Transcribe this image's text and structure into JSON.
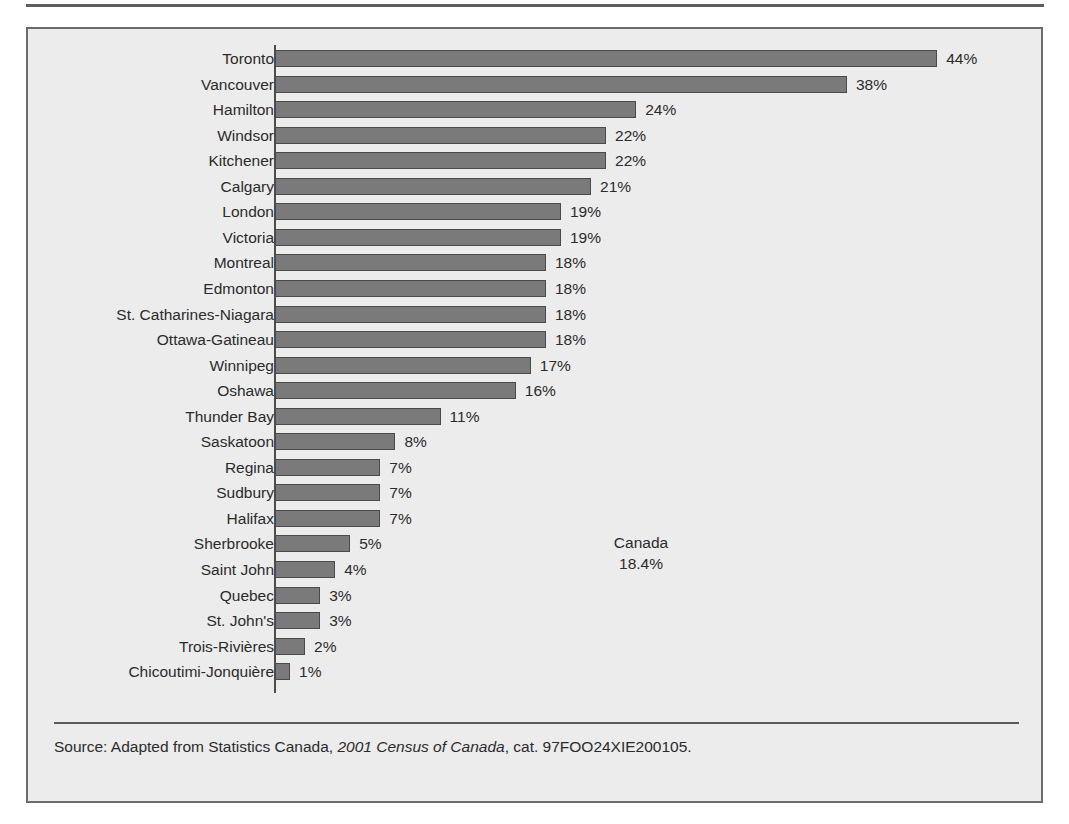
{
  "chart_data": {
    "type": "bar",
    "orientation": "horizontal",
    "title": "",
    "subtitle": "",
    "xlabel": "",
    "ylabel": "",
    "grid": false,
    "legend": null,
    "xlim": [
      0,
      44
    ],
    "value_suffix": "%",
    "categories": [
      "Toronto",
      "Vancouver",
      "Hamilton",
      "Windsor",
      "Kitchener",
      "Calgary",
      "London",
      "Victoria",
      "Montreal",
      "Edmonton",
      "St. Catharines-Niagara",
      "Ottawa-Gatineau",
      "Winnipeg",
      "Oshawa",
      "Thunder Bay",
      "Saskatoon",
      "Regina",
      "Sudbury",
      "Halifax",
      "Sherbrooke",
      "Saint John",
      "Quebec",
      "St. John's",
      "Trois-Rivières",
      "Chicoutimi-Jonquière"
    ],
    "values": [
      44,
      38,
      24,
      22,
      22,
      21,
      19,
      19,
      18,
      18,
      18,
      18,
      17,
      16,
      11,
      8,
      7,
      7,
      7,
      5,
      4,
      3,
      3,
      2,
      1
    ],
    "value_labels": [
      "44%",
      "38%",
      "24%",
      "22%",
      "22%",
      "21%",
      "19%",
      "19%",
      "18%",
      "18%",
      "18%",
      "18%",
      "17%",
      "16%",
      "11%",
      "8%",
      "7%",
      "7%",
      "7%",
      "5%",
      "4%",
      "3%",
      "3%",
      "2%",
      "1%"
    ],
    "annotations": [
      {
        "label": "Canada",
        "value_label": "18.4%",
        "value": 18.4
      }
    ],
    "bar_color": "#7a7a7a",
    "bar_border_color": "#4a4a4a",
    "background_color": "#ececec",
    "text_color": "#2b2b2b"
  },
  "annotation": {
    "name": "Canada",
    "value": "18.4%"
  },
  "source": {
    "prefix": "Source: Adapted from Statistics Canada, ",
    "title_italic": "2001 Census of Canada",
    "suffix": ", cat. 97FOO24XIE200105."
  }
}
